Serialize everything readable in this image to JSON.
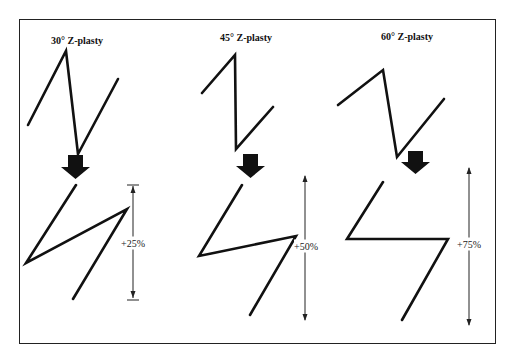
{
  "diagram": {
    "panels": [
      {
        "title": "30° Z-plasty",
        "gain": "+25%"
      },
      {
        "title": "45° Z-plasty",
        "gain": "+50%"
      },
      {
        "title": "60° Z-plasty",
        "gain": "+75%"
      }
    ],
    "colors": {
      "line": "#111111",
      "border": "#222222",
      "background": "#ffffff"
    }
  }
}
